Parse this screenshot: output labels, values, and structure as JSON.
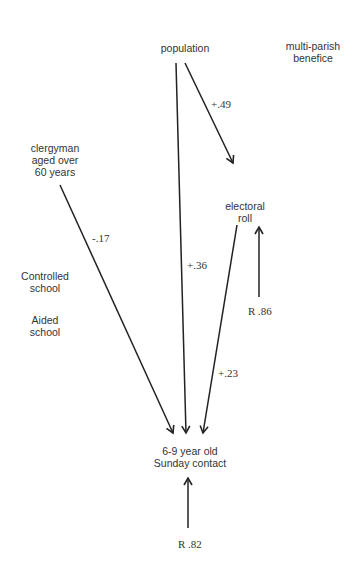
{
  "diagram": {
    "type": "path-analysis",
    "nodes": {
      "population": "population",
      "multi_parish": "multi-parish\nbenefice",
      "clergyman": "clergyman\naged over\n60 years",
      "electoral_roll": "electoral\nroll",
      "controlled_school": "Controlled\nschool",
      "aided_school": "Aided\nschool",
      "outcome": "6-9 year old\nSunday contact"
    },
    "paths": [
      {
        "from": "population",
        "to": "electoral roll",
        "coefficient": "+.49"
      },
      {
        "from": "population",
        "to": "6-9 year old Sunday contact",
        "coefficient": "+.36"
      },
      {
        "from": "clergyman aged over 60 years",
        "to": "6-9 year old Sunday contact",
        "coefficient": "-.17"
      },
      {
        "from": "electoral roll",
        "to": "6-9 year old Sunday contact",
        "coefficient": "+.23"
      }
    ],
    "residuals": {
      "electoral_roll": "R .86",
      "outcome": "R .82"
    },
    "labels": {
      "pop_roll": "+.49",
      "pop_outcome": "+.36",
      "clergy_outcome": "-.17",
      "roll_outcome": "+.23"
    },
    "colors": {
      "line": "#222222",
      "text": "#333333"
    }
  }
}
